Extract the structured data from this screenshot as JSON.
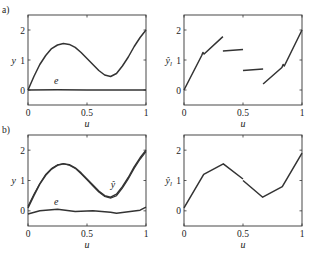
{
  "chart_data": [
    {
      "panel": "a",
      "position": "left",
      "type": "line",
      "panel_label": "a)",
      "xlabel": "u",
      "ylabel": "y",
      "xlim": [
        0,
        1
      ],
      "ylim": [
        -0.5,
        2.5
      ],
      "xticks": [
        "0",
        "0.5",
        "1"
      ],
      "yticks": [
        "0",
        "1",
        "2"
      ],
      "grid": false,
      "series": [
        {
          "name": "y",
          "x": [
            0,
            0.05,
            0.1,
            0.15,
            0.2,
            0.25,
            0.3,
            0.35,
            0.4,
            0.45,
            0.5,
            0.55,
            0.6,
            0.65,
            0.7,
            0.75,
            0.8,
            0.85,
            0.9,
            0.95,
            1.0
          ],
          "values": [
            0,
            0.45,
            0.85,
            1.15,
            1.38,
            1.5,
            1.55,
            1.52,
            1.42,
            1.25,
            1.05,
            0.85,
            0.65,
            0.5,
            0.45,
            0.55,
            0.8,
            1.1,
            1.45,
            1.75,
            2.0
          ]
        },
        {
          "name": "e",
          "x": [
            0,
            0.25,
            0.5,
            0.75,
            1.0
          ],
          "values": [
            0.0,
            0.01,
            0.0,
            0.0,
            0.0
          ]
        }
      ],
      "annotations": [
        {
          "text": "e",
          "u": 0.24,
          "y": 0.2
        }
      ]
    },
    {
      "panel": "a",
      "position": "right",
      "type": "line",
      "xlabel": "u",
      "ylabel": "ŷ",
      "ylabel_sub": "l",
      "xlim": [
        0,
        1
      ],
      "ylim": [
        -0.5,
        2.5
      ],
      "xticks": [
        "0",
        "0.5",
        "1"
      ],
      "yticks": [
        "0",
        "1",
        "2"
      ],
      "grid": false,
      "segments": [
        {
          "x": [
            0,
            0.15,
            0.16,
            0.17,
            0.33
          ],
          "values": [
            0,
            1.15,
            1.25,
            1.2,
            1.78
          ]
        },
        {
          "x": [
            0.33,
            0.5
          ],
          "values": [
            1.3,
            1.35
          ]
        },
        {
          "x": [
            0.5,
            0.67
          ],
          "values": [
            0.65,
            0.7
          ]
        },
        {
          "x": [
            0.67,
            0.83,
            0.84,
            0.85,
            1.0
          ],
          "values": [
            0.2,
            0.75,
            0.85,
            0.8,
            2.0
          ]
        }
      ]
    },
    {
      "panel": "b",
      "position": "left",
      "type": "line",
      "panel_label": "b)",
      "xlabel": "u",
      "ylabel": "y",
      "xlim": [
        0,
        1
      ],
      "ylim": [
        -0.5,
        2.5
      ],
      "xticks": [
        "0",
        "0.5",
        "1"
      ],
      "yticks": [
        "0",
        "1",
        "2"
      ],
      "grid": false,
      "series": [
        {
          "name": "y",
          "x": [
            0,
            0.05,
            0.1,
            0.15,
            0.2,
            0.25,
            0.3,
            0.35,
            0.4,
            0.45,
            0.5,
            0.55,
            0.6,
            0.65,
            0.7,
            0.75,
            0.8,
            0.85,
            0.9,
            0.95,
            1.0
          ],
          "values": [
            0.1,
            0.5,
            0.88,
            1.17,
            1.38,
            1.5,
            1.55,
            1.52,
            1.42,
            1.25,
            1.05,
            0.85,
            0.65,
            0.5,
            0.45,
            0.55,
            0.8,
            1.1,
            1.45,
            1.75,
            2.0
          ]
        },
        {
          "name": "ŷ",
          "x": [
            0,
            0.05,
            0.1,
            0.15,
            0.2,
            0.25,
            0.3,
            0.35,
            0.4,
            0.45,
            0.5,
            0.55,
            0.6,
            0.65,
            0.7,
            0.75,
            0.8,
            0.85,
            0.9,
            0.95,
            1.0
          ],
          "values": [
            0.15,
            0.55,
            0.9,
            1.2,
            1.4,
            1.52,
            1.55,
            1.5,
            1.4,
            1.22,
            1.02,
            0.82,
            0.62,
            0.47,
            0.42,
            0.5,
            0.75,
            1.05,
            1.4,
            1.7,
            1.95
          ]
        },
        {
          "name": "e",
          "x": [
            0,
            0.1,
            0.25,
            0.4,
            0.55,
            0.7,
            0.75,
            0.85,
            0.95,
            1.0
          ],
          "values": [
            -0.1,
            0.0,
            0.05,
            -0.02,
            0.0,
            -0.05,
            -0.08,
            -0.03,
            0.02,
            0.12
          ]
        }
      ],
      "annotations": [
        {
          "text": "e",
          "u": 0.24,
          "y": 0.2
        },
        {
          "text": "ŷ",
          "u": 0.72,
          "y": 0.75
        }
      ]
    },
    {
      "panel": "b",
      "position": "right",
      "type": "line",
      "xlabel": "u",
      "ylabel": "ŷ",
      "ylabel_sub": "l",
      "xlim": [
        0,
        1
      ],
      "ylim": [
        -0.5,
        2.5
      ],
      "xticks": [
        "0",
        "0.5",
        "1"
      ],
      "yticks": [
        "0",
        "1",
        "2"
      ],
      "grid": false,
      "segments": [
        {
          "x": [
            0,
            0.167,
            0.333,
            0.5
          ],
          "values": [
            0.1,
            1.2,
            1.55,
            1.05
          ]
        },
        {
          "x": [
            0.5,
            0.667,
            0.833,
            1.0
          ],
          "values": [
            1.0,
            0.45,
            0.8,
            1.9
          ]
        }
      ]
    }
  ]
}
